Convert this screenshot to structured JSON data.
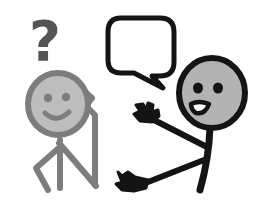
{
  "illustration": {
    "title": "Two stick figures conversing",
    "background_color": "#ffffff",
    "width": 261,
    "height": 201
  },
  "palette": {
    "black": "#141414",
    "gray_stroke": "#7d7d7d",
    "gray_fill": "#b3b3b3",
    "light_gray_fill": "#bdbdbd",
    "question_mark_color": "#555555",
    "white": "#ffffff"
  },
  "figures": [
    {
      "id": "listener",
      "name": "listening-stick-figure",
      "side": "left",
      "style": "gray-outline",
      "head_fill": "#bdbdbd",
      "stroke": "#7d7d7d",
      "expression": "smiling",
      "eyes": 2,
      "mouth": "smile",
      "pose": "hand-raised-to-chin-confused",
      "accessory": "question-mark"
    },
    {
      "id": "speaker",
      "name": "speaking-stick-figure",
      "side": "right",
      "style": "black-outline",
      "head_fill": "#b3b3b3",
      "stroke": "#141414",
      "expression": "talking",
      "eyes": 2,
      "mouth": "open",
      "pose": "both-hands-gesturing",
      "accessory": "speech-bubble"
    }
  ],
  "question_mark": {
    "name": "question-mark-symbol",
    "glyph": "?",
    "color": "#555555",
    "meaning": "confusion"
  },
  "speech_bubble": {
    "name": "speech-bubble",
    "text": "",
    "shape": "rounded-rectangle",
    "tail_direction": "down-left",
    "stroke": "#141414",
    "fill": "#ffffff"
  }
}
